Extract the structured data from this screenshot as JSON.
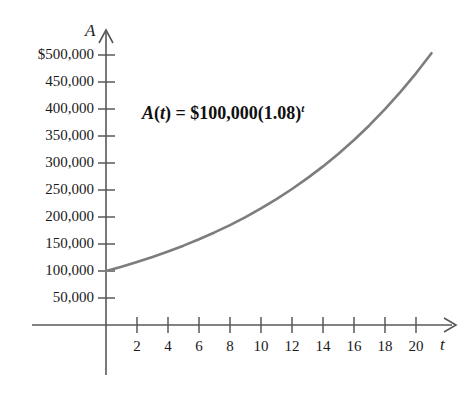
{
  "chart_data": {
    "type": "line",
    "title": "",
    "subtitle": "",
    "xlabel": "t",
    "ylabel": "A",
    "annotation": "A(t) = $100,000(1.08)^t",
    "annotation_parts": {
      "func_name": "A",
      "open_paren": "(",
      "var": "t",
      "close_paren": ")",
      "equals": " = ",
      "principal": "$100,000",
      "base_open": "(",
      "base": "1.08",
      "base_close": ")",
      "exponent": "t"
    },
    "formula": {
      "principal": 100000,
      "growth_rate": 1.08,
      "expression": "A(t) = 100000 * 1.08^t"
    },
    "grid": false,
    "legend": false,
    "xlim": [
      0,
      21.5
    ],
    "ylim": [
      0,
      530000
    ],
    "xticks": [
      2,
      4,
      6,
      8,
      10,
      12,
      14,
      16,
      18,
      20
    ],
    "xtick_labels": [
      "2",
      "4",
      "6",
      "8",
      "10",
      "12",
      "14",
      "16",
      "18",
      "20"
    ],
    "yticks": [
      50000,
      100000,
      150000,
      200000,
      250000,
      300000,
      350000,
      400000,
      450000,
      500000
    ],
    "ytick_labels": [
      "50,000",
      "100,000",
      "150,000",
      "200,000",
      "250,000",
      "300,000",
      "350,000",
      "400,000",
      "450,000",
      "$500,000"
    ],
    "series": [
      {
        "name": "A(t)",
        "color": "#7d7d7d",
        "x": [
          0,
          1,
          2,
          3,
          4,
          5,
          6,
          7,
          8,
          9,
          10,
          11,
          12,
          13,
          14,
          15,
          16,
          17,
          18,
          19,
          20,
          21
        ],
        "values": [
          100000,
          108000,
          116640,
          125971,
          136049,
          146933,
          158687,
          171382,
          185093,
          199900,
          215892,
          233164,
          251817,
          271962,
          293719,
          317217,
          342594,
          370002,
          399602,
          431570,
          466096,
          503383
        ]
      }
    ],
    "axis_style": {
      "axis_color": "#555555",
      "curve_color": "#7d7d7d",
      "arrow_x": true,
      "arrow_y": true
    }
  }
}
